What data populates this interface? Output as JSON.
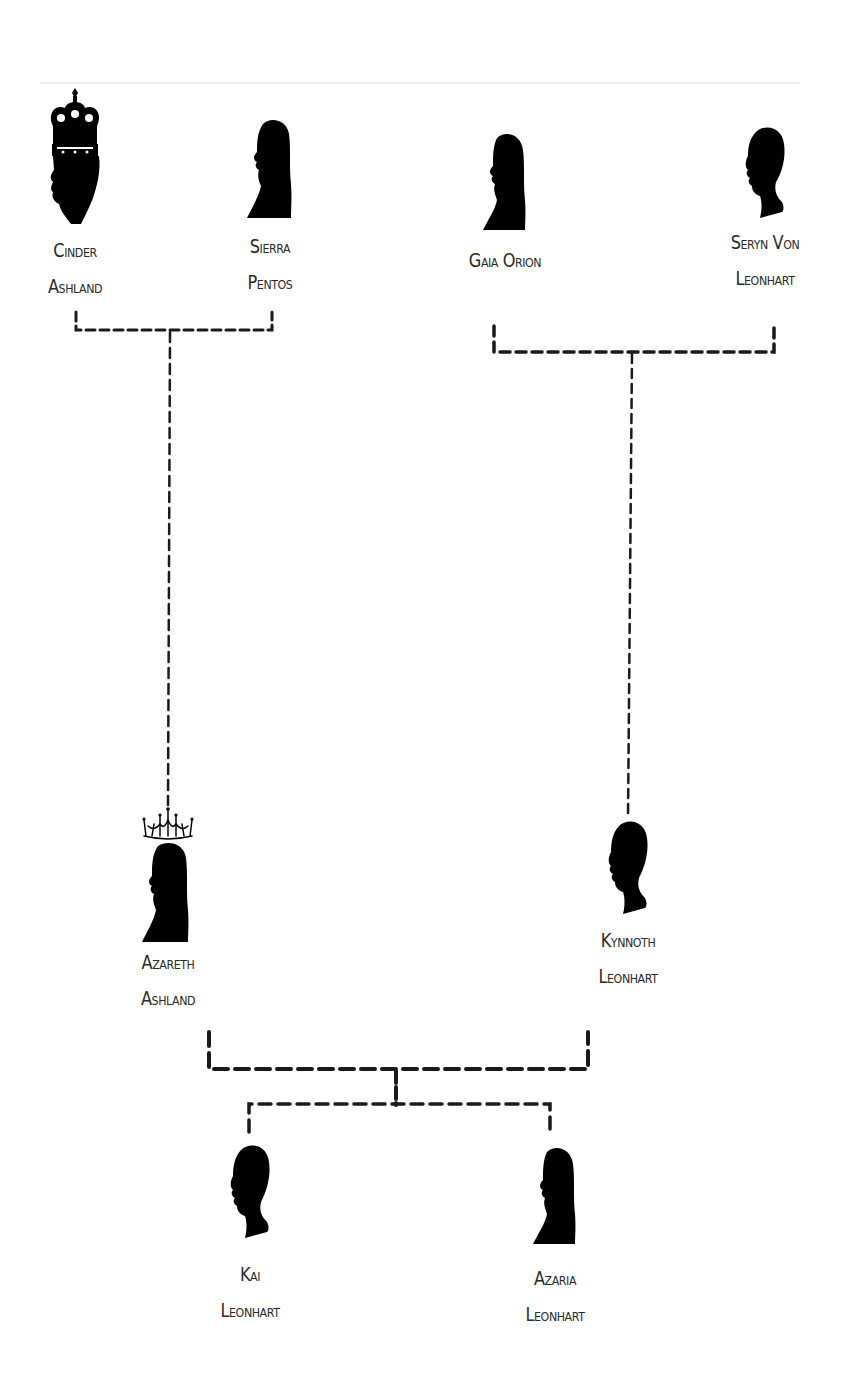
{
  "diagram": {
    "type": "family-tree",
    "colors": {
      "line": "#1a1a1a",
      "silhouette": "#000000",
      "text": "#2a2a2a",
      "background": "#ffffff"
    },
    "people": [
      {
        "id": "cinder",
        "line1": "Cinder",
        "line2": "Ashland",
        "gender": "male",
        "crown": "royal-crown",
        "generation": 1
      },
      {
        "id": "sierra",
        "line1": "Sierra",
        "line2": "Pentos",
        "gender": "female",
        "crown": "none",
        "generation": 1
      },
      {
        "id": "gaia",
        "line1": "Gaia Orion",
        "line2": "",
        "gender": "female",
        "crown": "none",
        "generation": 1
      },
      {
        "id": "seryn",
        "line1": "Seryn Von",
        "line2": "Leonhart",
        "gender": "male",
        "crown": "none",
        "generation": 1
      },
      {
        "id": "azareth",
        "line1": "Azareth",
        "line2": "Ashland",
        "gender": "female",
        "crown": "tiara",
        "generation": 2
      },
      {
        "id": "kynnoth",
        "line1": "Kynnoth",
        "line2": "Leonhart",
        "gender": "male",
        "crown": "none",
        "generation": 2
      },
      {
        "id": "kai",
        "line1": "Kai",
        "line2": "Leonhart",
        "gender": "male",
        "crown": "none",
        "generation": 3
      },
      {
        "id": "azaria",
        "line1": "Azaria",
        "line2": "Leonhart",
        "gender": "female",
        "crown": "none",
        "generation": 3
      }
    ],
    "unions": [
      {
        "partners": [
          "cinder",
          "sierra"
        ],
        "children": [
          "azareth"
        ]
      },
      {
        "partners": [
          "gaia",
          "seryn"
        ],
        "children": [
          "kynnoth"
        ]
      },
      {
        "partners": [
          "azareth",
          "kynnoth"
        ],
        "children": [
          "kai",
          "azaria"
        ]
      }
    ]
  }
}
